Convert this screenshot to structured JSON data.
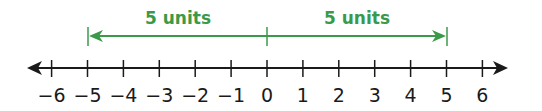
{
  "number_line": {
    "min": -6,
    "max": 6,
    "step": 1,
    "ticks": [
      -6,
      -5,
      -4,
      -3,
      -2,
      -1,
      0,
      1,
      2,
      3,
      4,
      5,
      6
    ],
    "tick_labels": [
      "−6",
      "−5",
      "−4",
      "−3",
      "−2",
      "−1",
      "0",
      "1",
      "2",
      "3",
      "4",
      "5",
      "6"
    ],
    "arrows_both_ends": true,
    "axis_color": "#1a1a1a"
  },
  "distances": [
    {
      "from": 0,
      "to": -5,
      "label": "5 units",
      "direction": "left"
    },
    {
      "from": 0,
      "to": 5,
      "label": "5 units",
      "direction": "right"
    }
  ],
  "colors": {
    "accent": "#3a9a4a",
    "axis": "#1a1a1a",
    "background": "#ffffff"
  }
}
